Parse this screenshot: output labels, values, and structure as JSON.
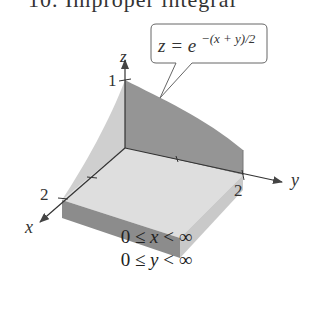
{
  "header": {
    "cut_text": "10. Improper integral"
  },
  "diagram": {
    "axes": {
      "x_label": "x",
      "y_label": "y",
      "z_label": "z"
    },
    "ticks": {
      "z_tick": "1",
      "x_tick": "2",
      "y_tick": "2"
    },
    "callout": {
      "lhs": "z = e",
      "exponent": "−(x + y)/2"
    },
    "colors": {
      "dark_face": "#8f8f8f",
      "floor": "#dcdcdc",
      "light_face": "#c8c8c8",
      "axis": "#333333"
    }
  },
  "constraints": [
    {
      "text_pre": "0 ≤ ",
      "var": "x",
      "text_post": " < ∞"
    },
    {
      "text_pre": "0 ≤ ",
      "var": "y",
      "text_post": " < ∞"
    }
  ]
}
